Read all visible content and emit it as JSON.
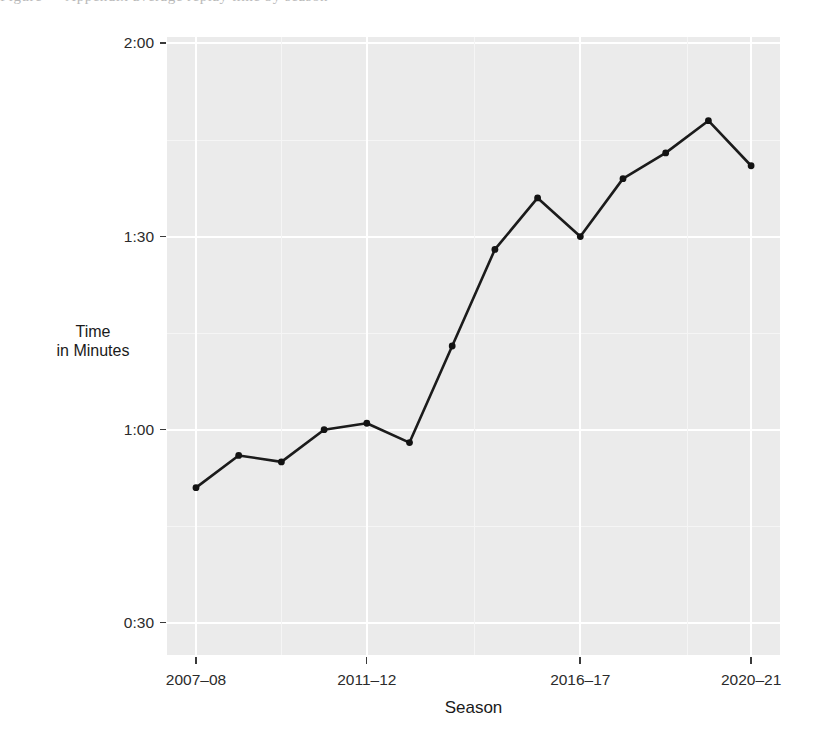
{
  "figure": {
    "background_color": "#ffffff",
    "panel_color": "#ebebeb",
    "gridline_color": "#ffffff",
    "line_color": "#1b1b1b",
    "point_color": "#121212",
    "cropped_caption_remnant": "Figure  — Appendix  average  replay  time  by  season"
  },
  "axes": {
    "x_title": "Season",
    "y_title_line1": "Time",
    "y_title_line2": "in Minutes",
    "y_tick_labels": [
      "2:00",
      "1:30",
      "1:00",
      "0:30"
    ],
    "x_tick_labels": [
      "2007–08",
      "2011–12",
      "2016–17",
      "2020–21"
    ]
  },
  "chart_data": {
    "type": "line",
    "title": "",
    "subtitle": "",
    "xlabel": "Season",
    "ylabel": "Time in Minutes",
    "grid": true,
    "legend": "none",
    "x_tick_labels": [
      "2007–08",
      "2011–12",
      "2016–17",
      "2020–21"
    ],
    "y_tick_labels": [
      "0:30",
      "1:00",
      "1:30",
      "2:00"
    ],
    "y_tick_values_seconds": [
      30,
      60,
      90,
      120
    ],
    "ylim_seconds": [
      25,
      121
    ],
    "categories": [
      "2007–08",
      "2008–09",
      "2009–10",
      "2010–11",
      "2011–12",
      "2012–13",
      "2013–14",
      "2014–15",
      "2015–16",
      "2016–17",
      "2017–18",
      "2018–19",
      "2019–20",
      "2020–21"
    ],
    "values_seconds": [
      51,
      56,
      55,
      60,
      61,
      58,
      73,
      88,
      96,
      90,
      99,
      103,
      108,
      101
    ],
    "values_formatted": [
      "0:51",
      "0:56",
      "0:55",
      "1:00",
      "1:01",
      "0:58",
      "1:13",
      "1:28",
      "1:36",
      "1:30",
      "1:39",
      "1:43",
      "1:48",
      "1:41"
    ],
    "series": [
      {
        "name": "Average time",
        "values": [
          51,
          56,
          55,
          60,
          61,
          58,
          73,
          88,
          96,
          90,
          99,
          103,
          108,
          101
        ]
      }
    ]
  }
}
